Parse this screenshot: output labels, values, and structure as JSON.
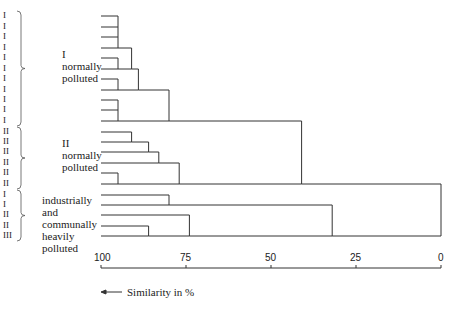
{
  "chart_data": {
    "type": "dendrogram",
    "title": "",
    "xlabel": "Similarity in %",
    "x_axis": {
      "ticks": [
        100,
        75,
        50,
        25,
        0
      ],
      "range": [
        100,
        0
      ],
      "direction": "decreasing left to right"
    },
    "groups": [
      {
        "name": "I normally polluted",
        "label_lines": [
          "I",
          "normally",
          "polluted"
        ],
        "leaves": [
          "I",
          "I",
          "I",
          "I",
          "I",
          "I",
          "I",
          "I",
          "I",
          "I",
          "I"
        ]
      },
      {
        "name": "II normally polluted",
        "label_lines": [
          "II",
          "normally",
          "polluted"
        ],
        "leaves": [
          "II",
          "II",
          "II",
          "II",
          "II",
          "II"
        ]
      },
      {
        "name": "industrially and communally heavily polluted",
        "label_lines": [
          "industrially",
          "and",
          "communally",
          "heavily",
          "polluted"
        ],
        "leaves": [
          "I",
          "I",
          "II",
          "II",
          "III"
        ]
      }
    ],
    "merges": [
      {
        "id": "a",
        "members": [
          "L1",
          "L2",
          "L3",
          "L4"
        ],
        "similarity": 95
      },
      {
        "id": "b",
        "members": [
          "L5",
          "L6"
        ],
        "similarity": 95
      },
      {
        "id": "c",
        "members": [
          "a",
          "b"
        ],
        "similarity": 91
      },
      {
        "id": "d",
        "members": [
          "L7",
          "L8"
        ],
        "similarity": 95
      },
      {
        "id": "e",
        "members": [
          "c",
          "d"
        ],
        "similarity": 89
      },
      {
        "id": "f",
        "members": [
          "L9",
          "L10",
          "L11"
        ],
        "similarity": 95
      },
      {
        "id": "g",
        "members": [
          "e",
          "f"
        ],
        "similarity": 80
      },
      {
        "id": "h",
        "members": [
          "L12",
          "L13"
        ],
        "similarity": 91
      },
      {
        "id": "i",
        "members": [
          "h",
          "L14"
        ],
        "similarity": 86
      },
      {
        "id": "j",
        "members": [
          "i",
          "L15"
        ],
        "similarity": 83
      },
      {
        "id": "k",
        "members": [
          "L16",
          "L17"
        ],
        "similarity": 95
      },
      {
        "id": "l",
        "members": [
          "j",
          "k"
        ],
        "similarity": 77
      },
      {
        "id": "m",
        "members": [
          "g",
          "l"
        ],
        "similarity": 41
      },
      {
        "id": "n",
        "members": [
          "L18",
          "L19"
        ],
        "similarity": 80
      },
      {
        "id": "o",
        "members": [
          "L21",
          "L22"
        ],
        "similarity": 86
      },
      {
        "id": "p",
        "members": [
          "L20",
          "o"
        ],
        "similarity": 74
      },
      {
        "id": "q",
        "members": [
          "n",
          "p"
        ],
        "similarity": 32
      },
      {
        "id": "r",
        "members": [
          "m",
          "q"
        ],
        "similarity": 0
      }
    ]
  },
  "layout": {
    "x100": 101,
    "x0": 441,
    "leaf_y": [
      16,
      27,
      37,
      48,
      58,
      69,
      79,
      90,
      100,
      110,
      121,
      132,
      142,
      152,
      163,
      173,
      184,
      195,
      205,
      215,
      226,
      236
    ],
    "axis_y": 268,
    "tick_label_y": 252,
    "line_color": "#333333"
  },
  "labels": {
    "group1": [
      "I",
      "normally",
      "polluted"
    ],
    "group2": [
      "II",
      "normally",
      "polluted"
    ],
    "group3": [
      "industrially",
      "and",
      "communally",
      "heavily",
      "polluted"
    ],
    "similarity": "Similarity in %",
    "ticks": [
      "100",
      "75",
      "50",
      "25",
      "0"
    ]
  }
}
